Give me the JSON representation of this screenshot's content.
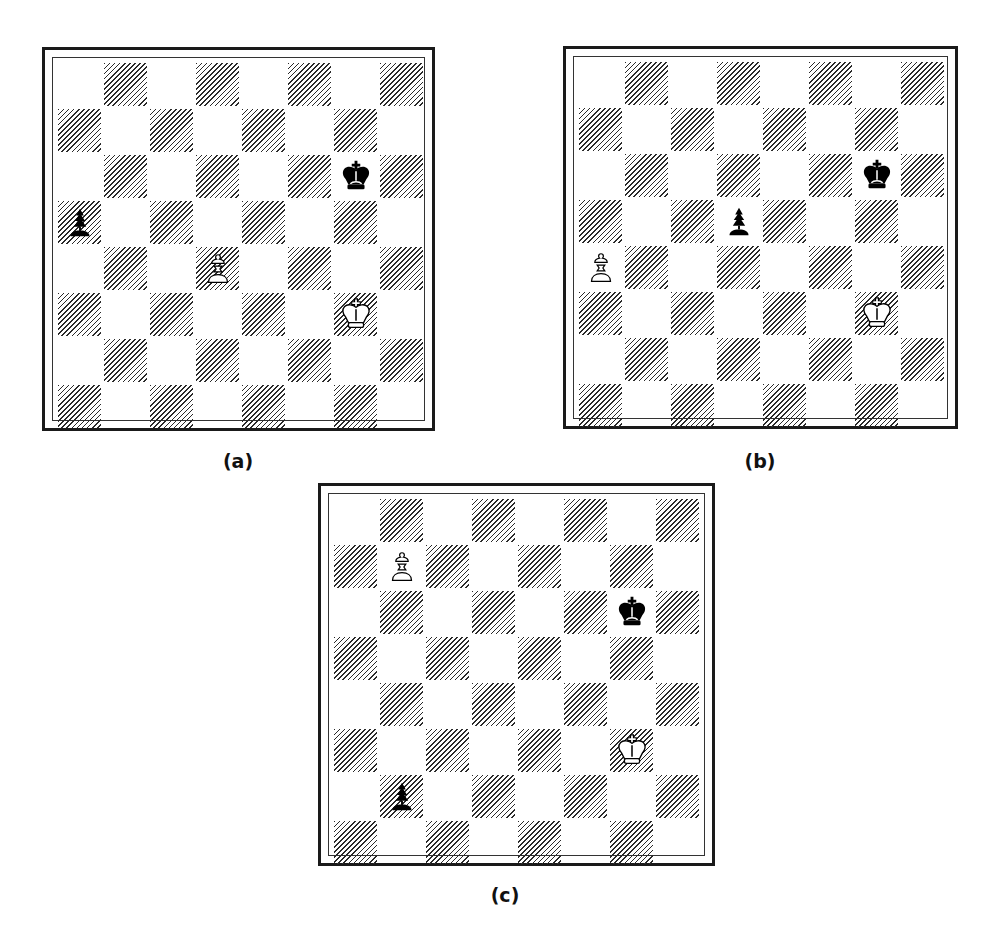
{
  "figure": {
    "boards": [
      {
        "id": "a",
        "caption": "(a)",
        "pieces": [
          {
            "square": "g6",
            "color": "black",
            "type": "king"
          },
          {
            "square": "a5",
            "color": "black",
            "type": "pawn"
          },
          {
            "square": "d4",
            "color": "white",
            "type": "pawn"
          },
          {
            "square": "g3",
            "color": "white",
            "type": "king"
          }
        ]
      },
      {
        "id": "b",
        "caption": "(b)",
        "pieces": [
          {
            "square": "g6",
            "color": "black",
            "type": "king"
          },
          {
            "square": "d5",
            "color": "black",
            "type": "pawn"
          },
          {
            "square": "a4",
            "color": "white",
            "type": "pawn"
          },
          {
            "square": "g3",
            "color": "white",
            "type": "king"
          }
        ]
      },
      {
        "id": "c",
        "caption": "(c)",
        "pieces": [
          {
            "square": "b7",
            "color": "white",
            "type": "pawn"
          },
          {
            "square": "g6",
            "color": "black",
            "type": "king"
          },
          {
            "square": "g3",
            "color": "white",
            "type": "king"
          },
          {
            "square": "b2",
            "color": "black",
            "type": "pawn"
          }
        ]
      }
    ],
    "colors": {
      "border": "#1a1a1a",
      "hatch": "#2a2a2a",
      "light_square": "#ffffff"
    }
  }
}
